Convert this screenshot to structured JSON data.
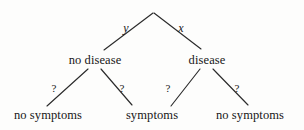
{
  "diagram": {
    "type": "decision-tree",
    "title": "",
    "width": 304,
    "height": 130,
    "stroke_color": "#2b2b2b",
    "background_color": "#fdfdfc",
    "root": {
      "label": "",
      "x": 153,
      "y": 12
    },
    "nodes": [
      {
        "id": "no-disease",
        "label": "no disease",
        "x": 95,
        "y": 60,
        "level": 1
      },
      {
        "id": "disease",
        "label": "disease",
        "x": 207,
        "y": 60,
        "level": 1
      },
      {
        "id": "no-symptoms-left",
        "label": "no symptoms",
        "x": 48,
        "y": 115,
        "level": 2
      },
      {
        "id": "symptoms",
        "label": "symptoms",
        "x": 152,
        "y": 115,
        "level": 2
      },
      {
        "id": "no-symptoms-right",
        "label": "no symptoms",
        "x": 250,
        "y": 115,
        "level": 2
      }
    ],
    "edges": [
      {
        "id": "root-to-no-disease",
        "from": "root",
        "to": "no-disease",
        "x1": 153,
        "y1": 13,
        "x2": 104,
        "y2": 50,
        "label": "y",
        "label_style": "var",
        "label_x": 126,
        "label_y": 28
      },
      {
        "id": "root-to-disease",
        "from": "root",
        "to": "disease",
        "x1": 154,
        "y1": 13,
        "x2": 201,
        "y2": 49,
        "label": "x",
        "label_style": "var",
        "label_x": 181,
        "label_y": 28
      },
      {
        "id": "no-disease-to-no-symptoms",
        "from": "no-disease",
        "to": "no-symptoms-left",
        "x1": 88,
        "y1": 69,
        "x2": 47,
        "y2": 106,
        "label": "?",
        "label_style": "unknown",
        "label_x": 54,
        "label_y": 88
      },
      {
        "id": "no-disease-to-symptoms",
        "from": "no-disease",
        "to": "symptoms",
        "x1": 101,
        "y1": 69,
        "x2": 132,
        "y2": 105,
        "label": "?",
        "label_style": "unknown",
        "label_x": 122,
        "label_y": 88
      },
      {
        "id": "disease-to-symptoms",
        "from": "disease",
        "to": "symptoms",
        "x1": 200,
        "y1": 69,
        "x2": 171,
        "y2": 106,
        "label": "?",
        "label_style": "unknown",
        "label_x": 168,
        "label_y": 88
      },
      {
        "id": "disease-to-no-symptoms",
        "from": "disease",
        "to": "no-symptoms-right",
        "x1": 213,
        "y1": 69,
        "x2": 248,
        "y2": 105,
        "label": "?",
        "label_style": "unknown",
        "label_x": 237,
        "label_y": 88
      }
    ]
  }
}
